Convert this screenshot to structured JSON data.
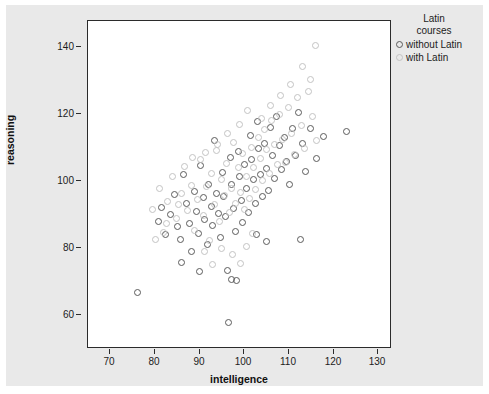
{
  "chart_data": {
    "type": "scatter",
    "title": "",
    "xlabel": "intelligence",
    "ylabel": "reasoning",
    "xlim": [
      65,
      133
    ],
    "ylim": [
      58,
      145
    ],
    "xticks": [
      70,
      80,
      90,
      100,
      110,
      120,
      130
    ],
    "yticks": [
      60,
      80,
      100,
      120,
      140
    ],
    "grid": false,
    "legend": {
      "title_line1": "Latin",
      "title_line2": "courses",
      "position": "top-right",
      "entries": [
        {
          "label": "without Latin",
          "color": "#5b5b5b",
          "marker": "open-circle"
        },
        {
          "label": "with Latin",
          "color": "#c3c3c3",
          "marker": "open-circle"
        }
      ]
    },
    "series": [
      {
        "name": "without Latin",
        "color": "#5b5b5b",
        "points": [
          [
            76.2,
            72.6
          ],
          [
            80.8,
            91.5
          ],
          [
            81.5,
            95.2
          ],
          [
            82.4,
            88.0
          ],
          [
            83.6,
            93.4
          ],
          [
            84.4,
            98.6
          ],
          [
            85.1,
            90.2
          ],
          [
            85.9,
            86.8
          ],
          [
            86.6,
            104.1
          ],
          [
            87.2,
            96.4
          ],
          [
            87.8,
            91.0
          ],
          [
            88.3,
            83.6
          ],
          [
            88.9,
            99.4
          ],
          [
            89.4,
            94.2
          ],
          [
            89.9,
            88.4
          ],
          [
            90.4,
            106.5
          ],
          [
            90.9,
            97.8
          ],
          [
            91.3,
            92.1
          ],
          [
            91.8,
            85.4
          ],
          [
            92.2,
            101.3
          ],
          [
            92.7,
            95.6
          ],
          [
            93.1,
            90.4
          ],
          [
            93.5,
            113.2
          ],
          [
            93.9,
            99.0
          ],
          [
            94.3,
            93.5
          ],
          [
            94.8,
            87.2
          ],
          [
            95.2,
            104.6
          ],
          [
            95.6,
            98.2
          ],
          [
            96.0,
            92.8
          ],
          [
            96.4,
            78.4
          ],
          [
            96.7,
            64.5
          ],
          [
            97.0,
            108.7
          ],
          [
            97.4,
            101.5
          ],
          [
            97.7,
            95.0
          ],
          [
            98.1,
            88.9
          ],
          [
            98.5,
            75.8
          ],
          [
            98.9,
            110.3
          ],
          [
            99.2,
            103.4
          ],
          [
            99.6,
            97.1
          ],
          [
            99.9,
            91.2
          ],
          [
            100.3,
            106.8
          ],
          [
            100.7,
            100.2
          ],
          [
            101.1,
            94.0
          ],
          [
            101.5,
            114.5
          ],
          [
            101.9,
            108.0
          ],
          [
            102.3,
            102.6
          ],
          [
            102.7,
            96.4
          ],
          [
            103.1,
            118.2
          ],
          [
            103.5,
            110.9
          ],
          [
            103.9,
            104.0
          ],
          [
            104.3,
            98.1
          ],
          [
            104.7,
            112.4
          ],
          [
            105.1,
            105.6
          ],
          [
            105.6,
            99.8
          ],
          [
            106.0,
            116.7
          ],
          [
            106.5,
            109.2
          ],
          [
            107.0,
            103.0
          ],
          [
            107.5,
            119.4
          ],
          [
            108.1,
            111.8
          ],
          [
            108.6,
            105.3
          ],
          [
            109.2,
            114.0
          ],
          [
            109.8,
            107.6
          ],
          [
            110.4,
            101.4
          ],
          [
            111.0,
            116.2
          ],
          [
            111.7,
            109.0
          ],
          [
            112.4,
            120.6
          ],
          [
            113.2,
            112.2
          ],
          [
            114.0,
            104.8
          ],
          [
            115.2,
            116.4
          ],
          [
            116.5,
            108.4
          ],
          [
            118.0,
            114.1
          ],
          [
            123.3,
            115.6
          ],
          [
            112.8,
            86.8
          ],
          [
            105.3,
            86.2
          ],
          [
            97.2,
            76.0
          ],
          [
            90.0,
            78.2
          ],
          [
            86.0,
            80.5
          ],
          [
            103.0,
            88.0
          ]
        ]
      },
      {
        "name": "with Latin",
        "color": "#c3c3c3",
        "points": [
          [
            79.6,
            94.6
          ],
          [
            81.0,
            100.2
          ],
          [
            82.0,
            88.6
          ],
          [
            83.0,
            96.8
          ],
          [
            84.0,
            103.4
          ],
          [
            85.0,
            92.2
          ],
          [
            86.0,
            99.0
          ],
          [
            86.8,
            106.2
          ],
          [
            87.5,
            94.4
          ],
          [
            88.2,
            101.0
          ],
          [
            89.0,
            89.2
          ],
          [
            89.7,
            97.4
          ],
          [
            90.3,
            108.0
          ],
          [
            91.0,
            93.0
          ],
          [
            91.6,
            100.8
          ],
          [
            92.3,
            86.4
          ],
          [
            92.9,
            104.2
          ],
          [
            93.4,
            96.0
          ],
          [
            94.0,
            110.4
          ],
          [
            94.6,
            91.6
          ],
          [
            95.1,
            102.8
          ],
          [
            95.7,
            98.4
          ],
          [
            96.2,
            107.0
          ],
          [
            96.8,
            93.8
          ],
          [
            97.3,
            100.4
          ],
          [
            97.8,
            112.6
          ],
          [
            98.3,
            96.2
          ],
          [
            98.8,
            105.8
          ],
          [
            99.3,
            99.2
          ],
          [
            99.8,
            109.6
          ],
          [
            100.3,
            94.8
          ],
          [
            100.8,
            103.6
          ],
          [
            101.3,
            97.6
          ],
          [
            101.8,
            111.2
          ],
          [
            102.3,
            106.0
          ],
          [
            102.8,
            100.0
          ],
          [
            103.3,
            113.8
          ],
          [
            103.8,
            108.2
          ],
          [
            104.3,
            102.4
          ],
          [
            104.8,
            116.0
          ],
          [
            105.3,
            110.6
          ],
          [
            105.9,
            104.2
          ],
          [
            106.4,
            118.4
          ],
          [
            107.0,
            112.0
          ],
          [
            107.6,
            106.6
          ],
          [
            108.2,
            120.0
          ],
          [
            108.8,
            113.4
          ],
          [
            109.4,
            107.2
          ],
          [
            110.1,
            121.8
          ],
          [
            110.8,
            115.0
          ],
          [
            111.5,
            109.4
          ],
          [
            112.2,
            124.6
          ],
          [
            113.0,
            117.2
          ],
          [
            113.8,
            111.0
          ],
          [
            114.6,
            126.2
          ],
          [
            115.5,
            119.6
          ],
          [
            116.4,
            113.2
          ],
          [
            115.0,
            129.4
          ],
          [
            113.4,
            132.8
          ],
          [
            116.2,
            138.4
          ],
          [
            110.6,
            128.0
          ],
          [
            108.4,
            125.2
          ],
          [
            106.2,
            122.4
          ],
          [
            104.0,
            119.0
          ],
          [
            101.0,
            121.0
          ],
          [
            99.0,
            117.4
          ],
          [
            96.4,
            115.0
          ],
          [
            94.2,
            112.0
          ],
          [
            91.5,
            110.0
          ],
          [
            88.6,
            108.6
          ],
          [
            85.4,
            96.0
          ],
          [
            82.6,
            91.0
          ],
          [
            80.2,
            86.8
          ],
          [
            97.6,
            82.6
          ],
          [
            99.4,
            80.4
          ],
          [
            95.0,
            84.2
          ],
          [
            93.0,
            80.0
          ],
          [
            100.6,
            84.8
          ],
          [
            102.0,
            88.4
          ],
          [
            91.2,
            83.6
          ]
        ]
      }
    ]
  }
}
